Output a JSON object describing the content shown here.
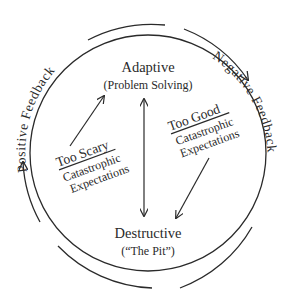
{
  "diagram": {
    "nodes": {
      "adaptive": {
        "title": "Adaptive",
        "subtitle": "(Problem Solving)"
      },
      "destructive": {
        "title": "Destructive",
        "subtitle": "(“The Pit”)"
      }
    },
    "transitions": {
      "too_scary": {
        "title": "Too Scary",
        "line1": "Catastrophic",
        "line2": "Expectations"
      },
      "too_good": {
        "title": "Too Good",
        "line1": "Catastrophic",
        "line2": "Expectations"
      }
    },
    "loops": {
      "positive": "Positive Feedback",
      "negative": "Negative Feedback"
    },
    "colors": {
      "ink": "#2a2a2a",
      "background": "#ffffff"
    }
  }
}
